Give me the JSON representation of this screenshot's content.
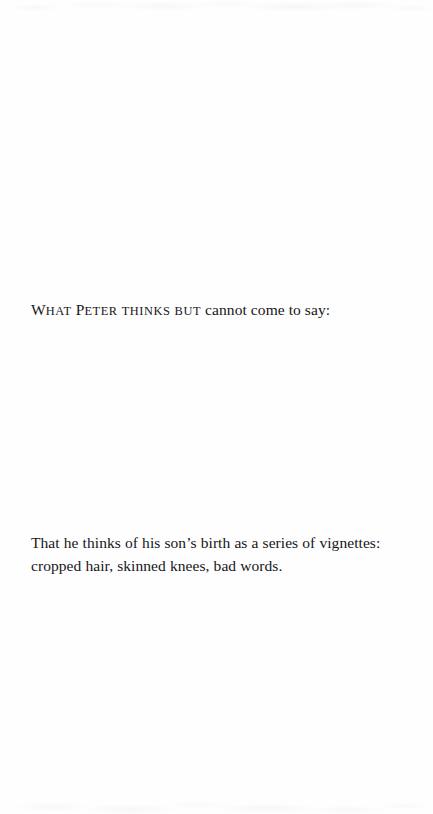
{
  "page": {
    "background_color": "#fefefe",
    "text_color": "#17171a",
    "heading": {
      "words": [
        {
          "lead": "W",
          "rest": "hat"
        },
        {
          "lead": "P",
          "rest": "eter"
        }
      ],
      "smallcaps_words": [
        "thinks",
        "but"
      ],
      "tail": "cannot come to say:",
      "full_text": "What Peter thinks but cannot come to say:"
    },
    "body": {
      "lines": [
        "That he thinks of his son’s birth as a series of vignettes: cropped hair,",
        "skinned knees, bad words."
      ],
      "full_text": "That he thinks of his son’s birth as a series of vignettes: cropped hair, skinned knees, bad words."
    }
  }
}
